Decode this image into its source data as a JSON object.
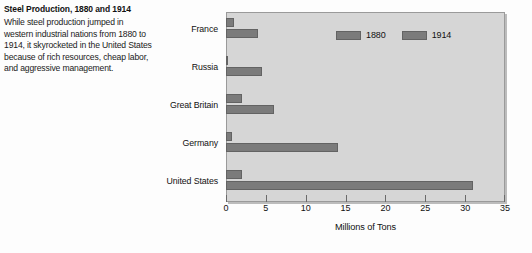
{
  "caption": {
    "title": "Steel Production, 1880 and 1914",
    "body": "While steel production jumped in western industrial nations from 1880 to 1914, it skyrocketed in the United States because of rich resources, cheap labor, and aggressive management."
  },
  "legend": {
    "items": [
      {
        "label": "1880",
        "color": "#7b7b7b"
      },
      {
        "label": "1914",
        "color": "#7b7b7b"
      }
    ]
  },
  "axis": {
    "x_title": "Millions of Tons",
    "x_ticks": [
      "0",
      "5",
      "10",
      "15",
      "20",
      "25",
      "30",
      "35"
    ]
  },
  "colors": {
    "bar": "#7b7b7b",
    "bar_border": "#636363",
    "plot_background": "#d6d6d6",
    "plot_border": "#9a9a9a",
    "text": "#111111"
  },
  "chart_data": {
    "type": "bar",
    "orientation": "horizontal",
    "title": "Steel Production, 1880 and 1914",
    "xlabel": "Millions of Tons",
    "ylabel": "",
    "xlim": [
      0,
      35
    ],
    "xticks": [
      0,
      5,
      10,
      15,
      20,
      25,
      30,
      35
    ],
    "grid": false,
    "legend_position": "inside-top-right",
    "categories": [
      "France",
      "Russia",
      "Great Britain",
      "Germany",
      "United States"
    ],
    "series": [
      {
        "name": "1880",
        "values": [
          1,
          0.3,
          2,
          0.7,
          2
        ]
      },
      {
        "name": "1914",
        "values": [
          4,
          4.5,
          6,
          14,
          31
        ]
      }
    ]
  }
}
